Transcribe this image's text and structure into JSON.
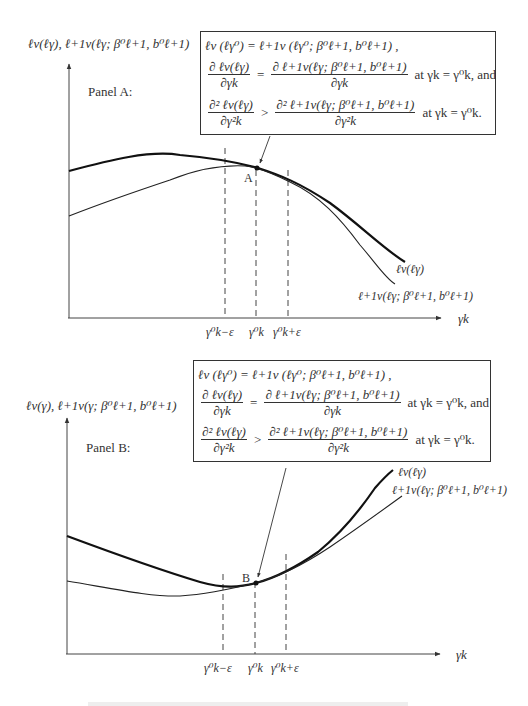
{
  "figure": {
    "panels": [
      {
        "label": "Panel A:",
        "y_axis_label": "ℓv(ℓγ),  ℓ+1v(ℓγ; β⁰ℓ+1, b⁰ℓ+1)",
        "x_axis_label": "γk",
        "point_label": "A",
        "curve_labels": {
          "thick": "ℓv(ℓγ)",
          "thin": "ℓ+1v(ℓγ; β⁰ℓ+1, b⁰ℓ+1)"
        },
        "tick_labels": [
          "γ⁰k−ε",
          "γ⁰k",
          "γ⁰k+ε"
        ],
        "box": {
          "line1": "ℓv (ℓγ⁰) = ℓ+1v (ℓγ⁰; β⁰ℓ+1, b⁰ℓ+1) ,",
          "line2_lhs_num": "∂ ℓv(ℓγ)",
          "line2_lhs_den": "∂γk",
          "line2_rhs_num": "∂ ℓ+1v(ℓγ; β⁰ℓ+1, b⁰ℓ+1)",
          "line2_rhs_den": "∂γk",
          "line2_tail": "at γk = γ⁰k, and",
          "line3_lhs_num": "∂² ℓv(ℓγ)",
          "line3_lhs_den": "∂γ²k",
          "line3_rhs_num": "∂² ℓ+1v(ℓγ; β⁰ℓ+1, b⁰ℓ+1)",
          "line3_rhs_den": "∂γ²k",
          "line3_tail": "at γk = γ⁰k."
        }
      },
      {
        "label": "Panel B:",
        "y_axis_label": "ℓv(γ),  ℓ+1v(γ; β⁰ℓ+1, b⁰ℓ+1)",
        "x_axis_label": "γk",
        "point_label": "B",
        "curve_labels": {
          "thick": "ℓv(ℓγ)",
          "thin": "ℓ+1v(ℓγ; β⁰ℓ+1, b⁰ℓ+1)"
        },
        "tick_labels": [
          "γ⁰k−ε",
          "γ⁰k",
          "γ⁰k+ε"
        ],
        "box": {
          "line1": "ℓv (ℓγ⁰) = ℓ+1v (ℓγ⁰; β⁰ℓ+1, b⁰ℓ+1) ,",
          "line2_lhs_num": "∂ ℓv(ℓγ)",
          "line2_lhs_den": "∂γk",
          "line2_rhs_num": "∂ ℓ+1v(ℓγ; β⁰ℓ+1, b⁰ℓ+1)",
          "line2_rhs_den": "∂γk",
          "line2_tail": "at γk = γ⁰k, and",
          "line3_lhs_num": "∂² ℓv(ℓγ)",
          "line3_lhs_den": "∂γ²k",
          "line3_rhs_num": "∂² ℓ+1v(ℓγ; β⁰ℓ+1, b⁰ℓ+1)",
          "line3_rhs_den": "∂γ²k",
          "line3_tail": "at γk = γ⁰k."
        }
      }
    ]
  },
  "colors": {
    "ink": "#333333",
    "background": "#ffffff"
  }
}
